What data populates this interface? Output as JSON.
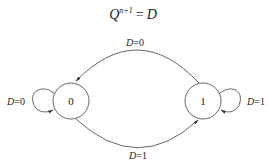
{
  "equation": {
    "lhs_var": "Q",
    "lhs_sup": "n+1",
    "equals": "=",
    "rhs": "D"
  },
  "states": [
    {
      "id": "s0",
      "label": "0"
    },
    {
      "id": "s1",
      "label": "1"
    }
  ],
  "transitions": [
    {
      "from": "0",
      "to": "0",
      "var": "D",
      "eq": "=0"
    },
    {
      "from": "0",
      "to": "1",
      "var": "D",
      "eq": "=1"
    },
    {
      "from": "1",
      "to": "0",
      "var": "D",
      "eq": "=0"
    },
    {
      "from": "1",
      "to": "1",
      "var": "D",
      "eq": "=1"
    }
  ],
  "colors": {
    "stroke": "#555555",
    "text": "#222222",
    "background": "#ffffff"
  }
}
